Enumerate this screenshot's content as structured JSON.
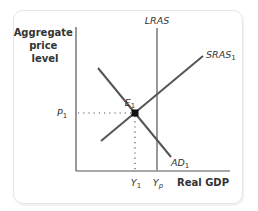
{
  "diagram": {
    "type": "AD-AS model",
    "y_axis_label_lines": [
      "Aggregate",
      "price",
      "level"
    ],
    "x_axis_label": "Real GDP",
    "curves": {
      "lras": {
        "label": "LRAS",
        "sub": ""
      },
      "sras": {
        "label": "SRAS",
        "sub": "1"
      },
      "ad": {
        "label": "AD",
        "sub": "1"
      }
    },
    "equilibrium": {
      "label": "E",
      "sub": "1"
    },
    "price_level": {
      "label": "P",
      "sub": "1"
    },
    "output_equilibrium": {
      "label": "Y",
      "sub": "1"
    },
    "output_potential": {
      "label": "Y",
      "sub": "p"
    },
    "colors": {
      "axis": "#555555",
      "curve": "#555555",
      "lras": "#999999",
      "point": "#111111",
      "dotted": "#555555",
      "card_border": "#e6e6e6"
    }
  }
}
